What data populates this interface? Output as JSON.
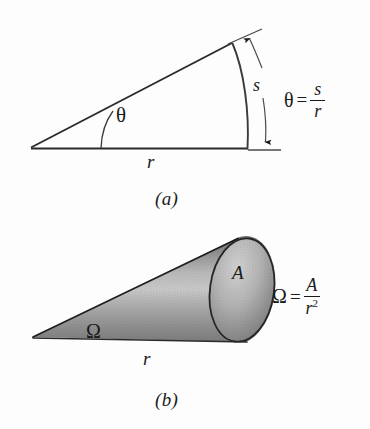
{
  "figure": {
    "background_color": "#fdfdfd",
    "ink_color": "#1a1a1a",
    "panels": [
      {
        "id": "a",
        "caption": "(a)",
        "description": "Plane angle: circular sector with radius r subtending arc length s at angle theta",
        "labels": {
          "angle": "θ",
          "radius": "r",
          "arc": "s"
        },
        "equation": {
          "lhs": "θ",
          "relation": "=",
          "numerator": "s",
          "denominator": "r",
          "denominator_exponent": ""
        }
      },
      {
        "id": "b",
        "caption": "(b)",
        "description": "Solid angle: shaded cone of length r with elliptical end cap of area A subtending solid angle Omega",
        "labels": {
          "angle": "Ω",
          "radius": "r",
          "area": "A"
        },
        "equation": {
          "lhs": "Ω",
          "relation": "=",
          "numerator": "A",
          "denominator": "r",
          "denominator_exponent": "2"
        }
      }
    ],
    "colors": {
      "cone_shade_dark": "#6f6f6f",
      "cone_shade_mid": "#a8a8a8",
      "cone_shade_light": "#cfcfcf",
      "cap_dark": "#7a7a7a",
      "cap_light": "#c8c8c8",
      "stroke": "#2a2a2a"
    }
  }
}
